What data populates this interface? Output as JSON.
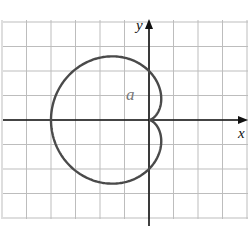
{
  "chart_data": {
    "type": "line",
    "title": "",
    "xlabel": "x",
    "ylabel": "y",
    "annotations": [
      {
        "text": "a",
        "x": -0.9,
        "y": 1.0
      }
    ],
    "grid": true,
    "xlim": [
      -6,
      4
    ],
    "ylim": [
      -4.2,
      4
    ],
    "curve": "cardioid r = a(1 - cos θ), a = 2",
    "series": [
      {
        "name": "cardioid",
        "points": [
          {
            "x": 0,
            "y": 0
          },
          {
            "x": 0.5,
            "y": 0.87
          },
          {
            "x": 0,
            "y": 2
          },
          {
            "x": -1.5,
            "y": 2.6
          },
          {
            "x": -3,
            "y": 1.73
          },
          {
            "x": -4,
            "y": 0
          },
          {
            "x": -3,
            "y": -1.73
          },
          {
            "x": -1.5,
            "y": -2.6
          },
          {
            "x": 0,
            "y": -2
          },
          {
            "x": 0.5,
            "y": -0.87
          },
          {
            "x": 0,
            "y": 0
          }
        ]
      }
    ],
    "a": 2
  },
  "labels": {
    "x_axis": "x",
    "y_axis": "y",
    "param": "a"
  },
  "colors": {
    "grid": "#bdbdbd",
    "axis": "#111111",
    "curve": "#4a4a4a"
  }
}
